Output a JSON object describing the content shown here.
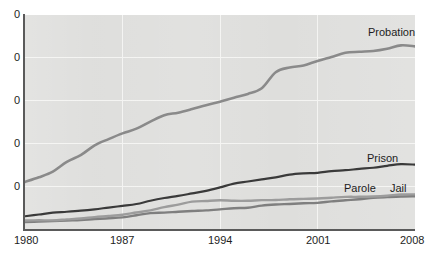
{
  "chart_data": {
    "type": "line",
    "title": "",
    "xlabel": "",
    "ylabel": "",
    "xlim": [
      1980,
      2008
    ],
    "ylim": [
      0,
      5000000
    ],
    "grid": true,
    "legend_position": "inline-right",
    "x_ticks": [
      "1980",
      "1987",
      "1994",
      "2001",
      "2008"
    ],
    "x_tick_values": [
      1980,
      1987,
      1994,
      2001,
      2008
    ],
    "y_ticks": [
      "0",
      "0",
      "0",
      "0",
      "0"
    ],
    "y_tick_values": [
      5000000,
      4000000,
      3000000,
      2000000,
      1000000
    ],
    "y_tick_note": "Leading digits of the y-axis tick labels are cropped off the left edge of the screenshot; only the trailing 0 of each label is visible.",
    "x": [
      1980,
      1981,
      1982,
      1983,
      1984,
      1985,
      1986,
      1987,
      1988,
      1989,
      1990,
      1991,
      1992,
      1993,
      1994,
      1995,
      1996,
      1997,
      1998,
      1999,
      2000,
      2001,
      2002,
      2003,
      2004,
      2005,
      2006,
      2007,
      2008
    ],
    "series": [
      {
        "name": "Probation",
        "color": "#8a8a8a",
        "values": [
          1118097,
          1225934,
          1357264,
          1582947,
          1740948,
          1968712,
          2114621,
          2247158,
          2356483,
          2522125,
          2670234,
          2728472,
          2811611,
          2903061,
          2981022,
          3077861,
          3164996,
          3296513,
          3670441,
          3779922,
          3826209,
          3931731,
          4024067,
          4120012,
          4143792,
          4162536,
          4215361,
          4293163,
          4270917
        ]
      },
      {
        "name": "Prison",
        "color": "#3a3a3a",
        "values": [
          319598,
          360029,
          402914,
          423898,
          448264,
          480568,
          522084,
          560812,
          603732,
          680907,
          743382,
          792535,
          850566,
          909381,
          990147,
          1078542,
          1127528,
          1176564,
          1224469,
          1287172,
          1316333,
          1330007,
          1367547,
          1390279,
          1421345,
          1448344,
          1492973,
          1532817,
          1518559
        ]
      },
      {
        "name": "Parole",
        "color": "#9c9c9c",
        "values": [
          220438,
          225539,
          224604,
          246440,
          266992,
          300203,
          325638,
          355505,
          407977,
          456803,
          531407,
          590442,
          658601,
          676100,
          690371,
          679421,
          679733,
          694787,
          696385,
          714457,
          723898,
          732333,
          750934,
          769925,
          771852,
          780616,
          798202,
          826097,
          828169
        ]
      },
      {
        "name": "Jail",
        "color": "#7f7f7f",
        "values": [
          182288,
          195085,
          207853,
          221815,
          233018,
          254986,
          272735,
          294092,
          341893,
          393303,
          403019,
          424129,
          441781,
          455500,
          479800,
          507044,
          518492,
          567079,
          592462,
          605943,
          621149,
          631240,
          665475,
          691301,
          713990,
          747529,
          765819,
          780174,
          785556
        ]
      }
    ],
    "series_labels": [
      {
        "name": "Probation",
        "text": "Probation"
      },
      {
        "name": "Prison",
        "text": "Prison"
      },
      {
        "name": "Parole",
        "text": "Parole"
      },
      {
        "name": "Jail",
        "text": "Jail"
      }
    ],
    "colors": {
      "plot_background": "#dededc",
      "gridline": "#f4f4f2",
      "axis": "#5a5a5a",
      "text": "#1d1d1d",
      "probation": "#8a8a8a",
      "prison": "#3a3a3a",
      "parole": "#9c9c9c",
      "jail": "#7f7f7f"
    }
  }
}
